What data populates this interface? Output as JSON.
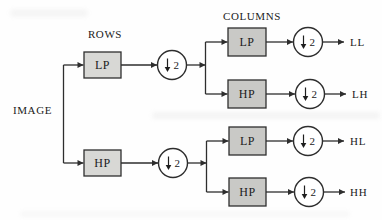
{
  "diagram": {
    "section_labels": {
      "rows": "ROWS",
      "columns": "COLUMNS"
    },
    "input_label": "IMAGE",
    "filters": {
      "rows_lp": "LP",
      "rows_hp": "HP",
      "cols_top_lp": "LP",
      "cols_top_hp": "HP",
      "cols_bottom_lp": "LP",
      "cols_bottom_hp": "HP"
    },
    "downsample": {
      "factor": "2"
    },
    "outputs": {
      "ll": "LL",
      "lh": "LH",
      "hl": "HL",
      "hh": "HH"
    },
    "colors": {
      "line": "#2e2e2e",
      "rows_box_fill": "#d8d8d5",
      "cols_box_fill": "#c9c9c6",
      "circle_fill": "#ffffff",
      "background": "#fefefe"
    }
  }
}
